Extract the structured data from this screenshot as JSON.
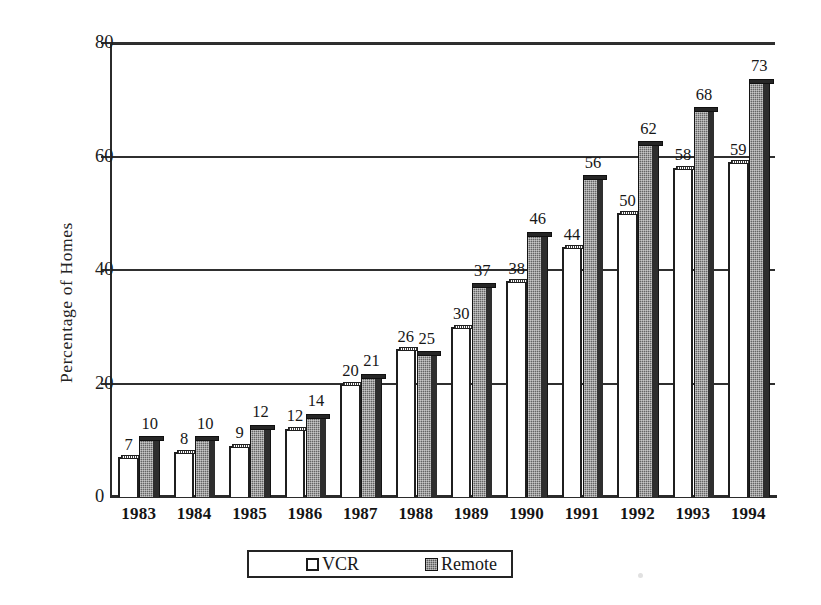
{
  "chart_data": {
    "type": "bar",
    "title": "",
    "subtitle": "",
    "xlabel": "",
    "ylabel": "Percentage of Homes",
    "categories": [
      "1983",
      "1984",
      "1985",
      "1986",
      "1987",
      "1988",
      "1989",
      "1990",
      "1991",
      "1992",
      "1993",
      "1994"
    ],
    "series": [
      {
        "name": "VCR",
        "color": "#ffffff",
        "values": [
          7,
          8,
          9,
          12,
          20,
          26,
          30,
          38,
          44,
          50,
          58,
          59
        ]
      },
      {
        "name": "Remote",
        "color": "#6f6f6f",
        "values": [
          10,
          10,
          12,
          14,
          21,
          25,
          37,
          46,
          56,
          62,
          68,
          73
        ]
      }
    ],
    "ylim": [
      0,
      80
    ],
    "yticks": [
      0,
      20,
      40,
      60,
      80
    ],
    "ytick_labels": [
      "0",
      "20",
      "40",
      "60",
      "80"
    ],
    "grid": "horizontal",
    "legend_position": "bottom",
    "data_labels": true
  },
  "legend": {
    "entries": [
      {
        "label": "VCR",
        "swatch": "open-square-swatch"
      },
      {
        "label": "Remote",
        "swatch": "filled-square-swatch"
      }
    ]
  },
  "axes": {
    "y_title": "Percentage of Homes"
  }
}
